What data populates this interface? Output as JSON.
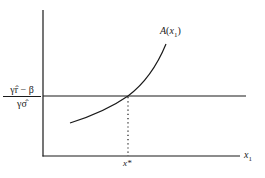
{
  "diagram": {
    "type": "economics-threshold-diagram",
    "curve_label": "A(x1)",
    "curve_label_parts": {
      "func": "A",
      "arg": "x",
      "sub": "1"
    },
    "threshold_label": {
      "numerator": "γr̂ − β",
      "denominator": "γσ̂"
    },
    "x_axis_label": {
      "var": "x",
      "sub": "1"
    },
    "intersection_label": "x*",
    "elements": [
      {
        "id": "y-axis",
        "kind": "axis",
        "orientation": "vertical"
      },
      {
        "id": "x-axis",
        "kind": "axis",
        "orientation": "horizontal"
      },
      {
        "id": "threshold-line",
        "kind": "horizontal-line",
        "label": "γr̂ − β / γσ̂"
      },
      {
        "id": "a-curve",
        "kind": "convex-increasing-curve",
        "label": "A(x1)"
      },
      {
        "id": "drop-line",
        "kind": "dotted-vertical",
        "from": "intersection",
        "to": "x-axis",
        "label": "x*"
      }
    ],
    "colors": {
      "ink": "#1a1a1a",
      "background": "#ffffff"
    }
  }
}
